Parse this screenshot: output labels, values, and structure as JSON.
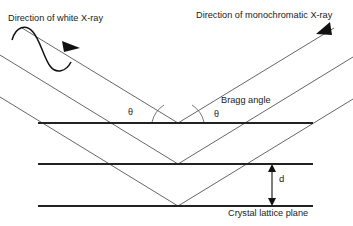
{
  "diagram": {
    "background_color": "#ffffff",
    "line_color": "#222222",
    "ray_color": "#555555",
    "labels": {
      "white_xray_direction": "Direction of white X-ray",
      "monochromatic_xray_direction": "Direction of monochromatic X-ray",
      "bragg_angle": "Bragg angle",
      "theta_left": "θ",
      "theta_right": "θ",
      "d_spacing": "d",
      "crystal_lattice_plane": "Crystal lattice plane"
    },
    "planes": [
      {
        "name": "lattice-plane-top",
        "y": 123,
        "x_start": 38,
        "x_end": 313
      },
      {
        "name": "lattice-plane-middle",
        "y": 164,
        "x_start": 38,
        "x_end": 313
      },
      {
        "name": "lattice-plane-bottom",
        "y": 206,
        "x_start": 38,
        "x_end": 313
      }
    ],
    "vertices": [
      {
        "name": "reflection-vertex-top",
        "x": 178,
        "y": 123
      },
      {
        "name": "reflection-vertex-middle",
        "x": 178,
        "y": 164
      },
      {
        "name": "reflection-vertex-bottom",
        "x": 178,
        "y": 206
      }
    ],
    "d_arrow": {
      "x": 272,
      "y_top": 164,
      "y_bottom": 206
    },
    "wave": {
      "cycles": 1,
      "orientation": "tilted-along-incident-ray"
    }
  }
}
